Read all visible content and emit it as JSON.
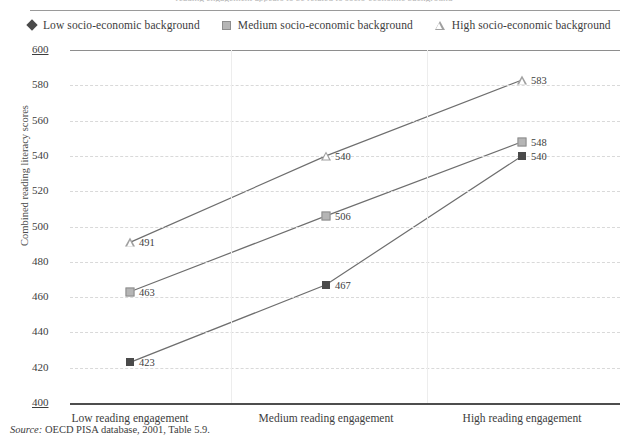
{
  "header": {
    "cutoff_text": "reading engagement appears to be related to socio-economic background"
  },
  "legend": {
    "position": "top-left",
    "items": [
      {
        "label": "Low socio-economic background",
        "marker": "diamond-icon",
        "color": "#4a4a4a"
      },
      {
        "label": "Medium socio-economic background",
        "marker": "square-icon",
        "color": "#b5b5b5"
      },
      {
        "label": "High socio-economic background",
        "marker": "triangle-icon",
        "color": "#a0a0a0"
      }
    ]
  },
  "source": {
    "prefix": "Source:",
    "text": "OECD PISA database, 2001, Table 5.9."
  },
  "chart_data": {
    "type": "line",
    "title": "",
    "xlabel": "",
    "ylabel": "Combined reading literacy scores",
    "categories": [
      "Low reading engagement",
      "Medium reading engagement",
      "High reading engagement"
    ],
    "ylim": [
      400,
      600
    ],
    "yticks": [
      400,
      420,
      440,
      460,
      480,
      500,
      520,
      540,
      560,
      580,
      600
    ],
    "grid": true,
    "series": [
      {
        "name": "Low socio-economic background",
        "marker": "diamond",
        "values": [
          423,
          467,
          540
        ]
      },
      {
        "name": "Medium socio-economic background",
        "marker": "square",
        "values": [
          463,
          506,
          548
        ]
      },
      {
        "name": "High socio-economic background",
        "marker": "triangle",
        "values": [
          491,
          540,
          583
        ]
      }
    ]
  }
}
